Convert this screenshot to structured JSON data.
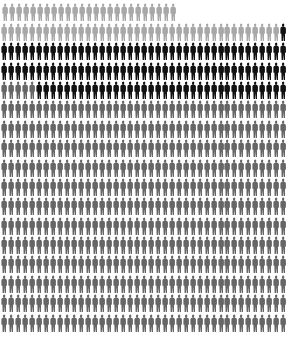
{
  "chart_data": {
    "type": "pictogram",
    "title": "",
    "columns": 41,
    "rows": 17,
    "unit_icon": "soldier-silhouette-icon",
    "colors": {
      "light_gray": "#a8a8a8",
      "black": "#111111",
      "mid_gray": "#666666"
    },
    "row_segments": [
      [
        {
          "color": "light_gray",
          "count": 25
        }
      ],
      [
        {
          "color": "light_gray",
          "count": 40
        },
        {
          "color": "black",
          "count": 1
        }
      ],
      [
        {
          "color": "black",
          "count": 41
        }
      ],
      [
        {
          "color": "black",
          "count": 41
        }
      ],
      [
        {
          "color": "mid_gray",
          "count": 5
        },
        {
          "color": "black",
          "count": 36
        }
      ],
      [
        {
          "color": "mid_gray",
          "count": 41
        }
      ],
      [
        {
          "color": "mid_gray",
          "count": 41
        }
      ],
      [
        {
          "color": "mid_gray",
          "count": 41
        }
      ],
      [
        {
          "color": "mid_gray",
          "count": 41
        }
      ],
      [
        {
          "color": "mid_gray",
          "count": 41
        }
      ],
      [
        {
          "color": "mid_gray",
          "count": 41
        }
      ],
      [
        {
          "color": "mid_gray",
          "count": 41
        }
      ],
      [
        {
          "color": "mid_gray",
          "count": 41
        }
      ],
      [
        {
          "color": "mid_gray",
          "count": 41
        }
      ],
      [
        {
          "color": "mid_gray",
          "count": 41
        }
      ],
      [
        {
          "color": "mid_gray",
          "count": 41
        }
      ],
      [
        {
          "color": "mid_gray",
          "count": 41
        }
      ]
    ],
    "series": [
      {
        "name": "light_gray",
        "value": 65
      },
      {
        "name": "black",
        "value": 119
      },
      {
        "name": "mid_gray",
        "value": 497
      }
    ]
  }
}
